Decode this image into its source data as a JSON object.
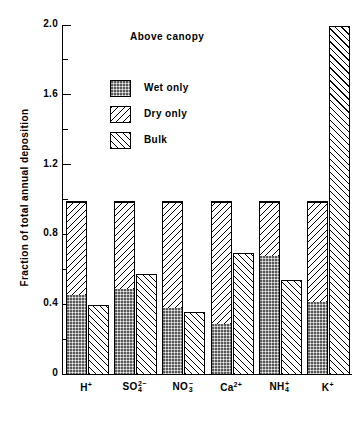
{
  "chart_data": {
    "type": "bar",
    "title": "Above canopy",
    "xlabel": "",
    "ylabel": "Fraction of total annual deposition",
    "ylim": [
      0,
      2.0
    ],
    "yticks": [
      0,
      0.4,
      0.8,
      1.2,
      1.6,
      2.0
    ],
    "ytick_labels": [
      "0",
      "0.4",
      "0.8",
      "1.2",
      "1.6",
      "2.0"
    ],
    "yminor_ticks": [
      0.2,
      0.6,
      1.0,
      1.4,
      1.8
    ],
    "grid": false,
    "legend_position": "upper-left-inside",
    "categories": [
      "H+",
      "SO4 2-",
      "NO3 -",
      "Ca2+",
      "NH4+",
      "K+"
    ],
    "category_labels": [
      {
        "base": "H",
        "sup": "+",
        "sub": ""
      },
      {
        "base": "SO",
        "sup": "2−",
        "sub": "4"
      },
      {
        "base": "NO",
        "sup": "−",
        "sub": "3"
      },
      {
        "base": "Ca",
        "sup": "2+",
        "sub": ""
      },
      {
        "base": "NH",
        "sup": "+",
        "sub": "4"
      },
      {
        "base": "K",
        "sup": "+",
        "sub": ""
      }
    ],
    "series": [
      {
        "name": "Wet only",
        "values": [
          0.45,
          0.49,
          0.38,
          0.285,
          0.675,
          0.415
        ],
        "stacked_group": "deposition",
        "fill": "stipple-grey"
      },
      {
        "name": "Dry only",
        "values": [
          0.55,
          0.51,
          0.62,
          0.715,
          0.325,
          0.585
        ],
        "stacked_group": "deposition",
        "fill": "hatch-backslash"
      },
      {
        "name": "Bulk",
        "values": [
          0.4,
          0.58,
          0.36,
          0.7,
          0.545,
          2.0
        ],
        "stacked_group": null,
        "fill": "hatch-slash"
      }
    ],
    "stacked_total": [
      1.0,
      1.0,
      1.0,
      1.0,
      1.0,
      1.0
    ]
  },
  "legend": {
    "items": [
      {
        "label": "Wet only",
        "fill": "stipple-grey"
      },
      {
        "label": "Dry only",
        "fill": "hatch-backslash"
      },
      {
        "label": "Bulk",
        "fill": "hatch-slash"
      }
    ]
  },
  "colors": {
    "axis": "#000000",
    "wet_fill": "#b7b7b7",
    "hatch": "#000000",
    "background": "#ffffff"
  }
}
